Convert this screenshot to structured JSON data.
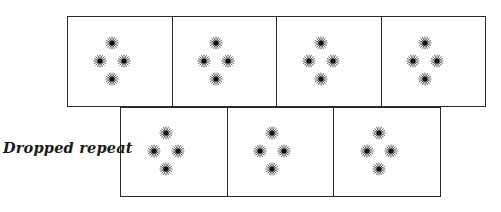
{
  "diagram": {
    "title": "",
    "label": "Dropped repeat",
    "stroke_color": "#2a2a2a",
    "motif_icon": "starburst-icon",
    "motif_count_per_tile": 4,
    "rows": [
      {
        "name": "top-row",
        "tiles": 4,
        "x": 67,
        "y": 16,
        "width": 418,
        "height": 91
      },
      {
        "name": "dropped-row",
        "tiles": 3,
        "x": 120,
        "y": 107,
        "width": 320,
        "height": 90
      }
    ]
  }
}
